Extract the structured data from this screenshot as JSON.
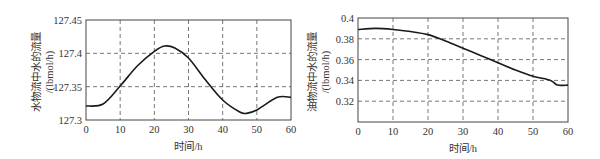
{
  "chart_data": [
    {
      "type": "line",
      "title": "",
      "xlabel": "时间/h",
      "ylabel_line1": "水物流中水的流量",
      "ylabel_line2": "/(lbmol/h)",
      "xlim": [
        0,
        60
      ],
      "ylim": [
        127.3,
        127.45
      ],
      "xticks": [
        "0",
        "10",
        "20",
        "30",
        "40",
        "50",
        "60"
      ],
      "yticks": [
        "127.3",
        "127.35",
        "127.4",
        "127.45"
      ],
      "grid": true,
      "grid_style": "dashed",
      "x": [
        0,
        5,
        10,
        15,
        20,
        23,
        26,
        30,
        35,
        40,
        45,
        47,
        50,
        56,
        60
      ],
      "series": [
        {
          "name": "water flow in water stream",
          "color": "#1a1a1a",
          "values": [
            127.321,
            127.324,
            127.351,
            127.381,
            127.403,
            127.411,
            127.408,
            127.393,
            127.36,
            127.33,
            127.312,
            127.31,
            127.315,
            127.334,
            127.334
          ]
        }
      ]
    },
    {
      "type": "line",
      "title": "",
      "xlabel": "时间/h",
      "ylabel_line1": "油物流中水的流量",
      "ylabel_line2": "/(lbmol/h)",
      "xlim": [
        0,
        60
      ],
      "ylim": [
        0.3,
        0.4
      ],
      "xticks": [
        "0",
        "10",
        "20",
        "30",
        "40",
        "50",
        "60"
      ],
      "yticks": [
        "0.32",
        "0.34",
        "0.36",
        "0.38",
        "0.4"
      ],
      "grid": true,
      "grid_style": "dashed",
      "x": [
        0,
        5,
        10,
        15,
        20,
        25,
        30,
        35,
        40,
        45,
        50,
        55,
        57,
        60
      ],
      "series": [
        {
          "name": "water flow in oil stream",
          "color": "#1a1a1a",
          "values": [
            0.389,
            0.39,
            0.389,
            0.387,
            0.384,
            0.378,
            0.371,
            0.364,
            0.357,
            0.35,
            0.344,
            0.34,
            0.3355,
            0.3355
          ]
        }
      ]
    }
  ]
}
